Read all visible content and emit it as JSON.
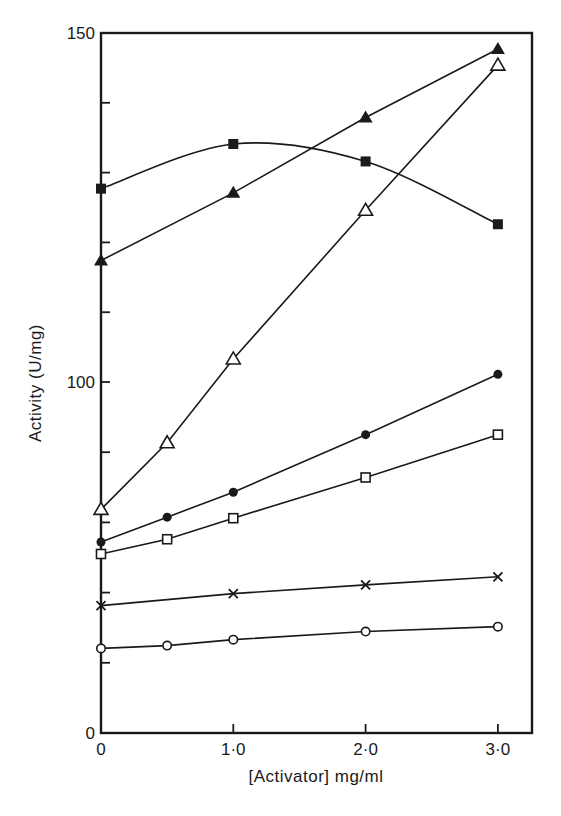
{
  "chart_data": {
    "type": "line",
    "title": "",
    "xlabel": "[Activator] mg/ml",
    "ylabel": "Activity (U/mg)",
    "xlim": [
      0,
      3.25
    ],
    "ylim": [
      0,
      150
    ],
    "y_axis_note": "Non-uniform scale as printed: 0-100 segment uses 20 units per minor tick; 100-150 segment uses 10 units per minor tick",
    "x_ticks": [
      {
        "value": 0,
        "label": "0"
      },
      {
        "value": 1.0,
        "label": "1·0"
      },
      {
        "value": 2.0,
        "label": "2·0"
      },
      {
        "value": 3.0,
        "label": "3·0"
      }
    ],
    "y_ticks_labeled": [
      {
        "value": 0,
        "label": "0"
      },
      {
        "value": 100,
        "label": "100"
      },
      {
        "value": 150,
        "label": "150"
      }
    ],
    "y_ticks_minor": [
      20,
      40,
      60,
      80,
      110,
      120,
      130,
      140
    ],
    "grid": false,
    "legend": null,
    "series": [
      {
        "name": "filled-square",
        "marker": "square-filled",
        "curve": "smooth",
        "x": [
          0,
          1.0,
          2.0,
          3.0
        ],
        "values": [
          127.7,
          134.1,
          131.6,
          122.6
        ]
      },
      {
        "name": "filled-triangle",
        "marker": "triangle-filled",
        "curve": "linear",
        "x": [
          0,
          1.0,
          2.0,
          3.0
        ],
        "values": [
          117.4,
          127.1,
          137.9,
          147.7
        ]
      },
      {
        "name": "open-triangle",
        "marker": "triangle-open",
        "curve": "linear",
        "x": [
          0,
          0.5,
          1.0,
          2.0,
          3.0
        ],
        "values": [
          63.7,
          82.7,
          103.3,
          124.6,
          145.4
        ]
      },
      {
        "name": "filled-circle",
        "marker": "circle-filled",
        "curve": "linear",
        "x": [
          0,
          0.5,
          1.0,
          2.0,
          3.0
        ],
        "values": [
          54.4,
          61.5,
          68.6,
          85.0,
          101.1
        ]
      },
      {
        "name": "open-square",
        "marker": "square-open",
        "curve": "linear",
        "x": [
          0,
          0.5,
          1.0,
          2.0,
          3.0
        ],
        "values": [
          51.0,
          55.2,
          61.2,
          72.8,
          85.0
        ]
      },
      {
        "name": "cross",
        "marker": "cross",
        "curve": "linear",
        "x": [
          0,
          1.0,
          2.0,
          3.0
        ],
        "values": [
          36.3,
          39.7,
          42.2,
          44.5
        ]
      },
      {
        "name": "open-circle",
        "marker": "circle-open",
        "curve": "linear",
        "x": [
          0,
          0.5,
          1.0,
          2.0,
          3.0
        ],
        "values": [
          24.1,
          24.9,
          26.6,
          28.9,
          30.3
        ]
      }
    ]
  },
  "colors": {
    "ink": "#1a1a1a",
    "background": "#ffffff"
  }
}
